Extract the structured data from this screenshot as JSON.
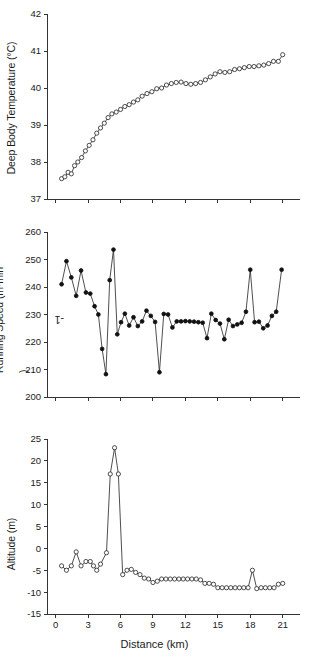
{
  "figure": {
    "title": "",
    "xlabel": "Distance (km)",
    "background": "#ffffff",
    "line_color": "#222222",
    "axis_color": "#333333"
  },
  "chart_data": [
    {
      "type": "line",
      "panel": "top",
      "title": "",
      "xlabel": "",
      "ylabel": "Deep Body Temperature (°C)",
      "ylabel_parts": {
        "text": "Deep Body Temperature (°C)"
      },
      "marker": "open-circle",
      "grid": false,
      "legend": "none",
      "xlim": [
        -0.8,
        22.6
      ],
      "ylim": [
        37,
        42
      ],
      "yticks": [
        37,
        38,
        39,
        40,
        41,
        42
      ],
      "ytick_labels": [
        "37",
        "38",
        "39",
        "40",
        "41",
        "42"
      ],
      "xticks": [
        0,
        3,
        6,
        9,
        12,
        15,
        18,
        21
      ],
      "xtick_labels": [],
      "x": [
        0.55,
        0.85,
        1.15,
        1.45,
        1.75,
        2.05,
        2.4,
        2.75,
        3.1,
        3.45,
        3.8,
        4.15,
        4.5,
        4.85,
        5.2,
        5.6,
        6.0,
        6.4,
        6.8,
        7.2,
        7.6,
        8.0,
        8.45,
        8.9,
        9.35,
        9.8,
        10.25,
        10.7,
        11.15,
        11.6,
        12.05,
        12.5,
        12.95,
        13.4,
        13.85,
        14.3,
        14.75,
        15.2,
        15.65,
        16.1,
        16.55,
        17.0,
        17.45,
        17.9,
        18.35,
        18.8,
        19.25,
        19.7,
        20.15,
        20.6,
        21.0
      ],
      "y": [
        37.55,
        37.6,
        37.72,
        37.68,
        37.9,
        38.0,
        38.12,
        38.3,
        38.45,
        38.6,
        38.78,
        38.92,
        39.05,
        39.2,
        39.3,
        39.35,
        39.42,
        39.5,
        39.55,
        39.62,
        39.68,
        39.78,
        39.85,
        39.9,
        39.98,
        40.0,
        40.08,
        40.12,
        40.15,
        40.16,
        40.12,
        40.1,
        40.12,
        40.15,
        40.22,
        40.3,
        40.38,
        40.44,
        40.42,
        40.44,
        40.5,
        40.52,
        40.55,
        40.58,
        40.58,
        40.6,
        40.62,
        40.66,
        40.72,
        40.72,
        40.9
      ]
    },
    {
      "type": "line",
      "panel": "middle",
      "title": "",
      "xlabel": "",
      "ylabel": "Running Speed (m·min⁻¹)",
      "marker": "filled-circle",
      "grid": false,
      "legend": "none",
      "xlim": [
        -0.8,
        22.6
      ],
      "ylim": [
        200,
        260
      ],
      "yticks": [
        200,
        210,
        220,
        230,
        240,
        250,
        260
      ],
      "ytick_labels": [
        "200",
        "210",
        "220",
        "230",
        "240",
        "250",
        "260"
      ],
      "xticks": [
        0,
        3,
        6,
        9,
        12,
        15,
        18,
        21
      ],
      "xtick_labels": [],
      "x": [
        0.55,
        1.0,
        1.45,
        1.9,
        2.35,
        2.8,
        3.2,
        3.6,
        3.95,
        4.3,
        4.65,
        5.0,
        5.35,
        5.7,
        6.05,
        6.4,
        6.8,
        7.2,
        7.6,
        8.0,
        8.4,
        8.8,
        9.2,
        9.6,
        10.0,
        10.4,
        10.8,
        11.2,
        11.6,
        12.0,
        12.4,
        12.8,
        13.2,
        13.6,
        14.0,
        14.4,
        14.8,
        15.2,
        15.6,
        16.0,
        16.4,
        16.8,
        17.2,
        17.6,
        18.0,
        18.4,
        18.8,
        19.2,
        19.6,
        20.0,
        20.4,
        20.9
      ],
      "y": [
        241.0,
        249.4,
        243.5,
        236.8,
        246.0,
        238.0,
        237.6,
        233.0,
        230.0,
        217.5,
        208.3,
        242.5,
        253.6,
        222.8,
        227.2,
        230.3,
        226.0,
        229.0,
        225.8,
        227.5,
        231.4,
        229.5,
        227.3,
        209.0,
        230.2,
        230.0,
        225.3,
        227.5,
        227.5,
        227.6,
        227.5,
        227.4,
        227.2,
        227.0,
        221.4,
        230.3,
        228.0,
        226.7,
        221.0,
        228.1,
        225.8,
        226.4,
        227.0,
        231.0,
        246.3,
        227.2,
        227.4,
        225.0,
        226.0,
        229.5,
        231.0,
        246.3
      ]
    },
    {
      "type": "line",
      "panel": "bottom",
      "title": "",
      "xlabel": "Distance (km)",
      "ylabel": "Altitude (m)",
      "marker": "open-circle",
      "grid": false,
      "legend": "none",
      "xlim": [
        -0.8,
        22.6
      ],
      "ylim": [
        -15,
        25
      ],
      "yticks": [
        -15,
        -10,
        -5,
        0,
        5,
        10,
        15,
        20,
        25
      ],
      "ytick_labels": [
        "-15",
        "-10",
        "-5",
        "0",
        "5",
        "10",
        "15",
        "20",
        "25"
      ],
      "xticks": [
        0,
        3,
        6,
        9,
        12,
        15,
        18,
        21
      ],
      "xtick_labels": [
        "0",
        "3",
        "6",
        "9",
        "12",
        "15",
        "18",
        "21"
      ],
      "x": [
        0.55,
        1.0,
        1.45,
        1.9,
        2.35,
        2.8,
        3.2,
        3.5,
        3.8,
        4.15,
        4.7,
        5.05,
        5.45,
        5.8,
        6.2,
        6.6,
        7.0,
        7.4,
        7.8,
        8.2,
        8.6,
        9.0,
        9.4,
        9.8,
        10.2,
        10.6,
        11.0,
        11.4,
        11.8,
        12.2,
        12.6,
        13.0,
        13.4,
        13.8,
        14.2,
        14.6,
        15.0,
        15.4,
        15.8,
        16.2,
        16.6,
        17.0,
        17.4,
        17.8,
        18.2,
        18.6,
        19.0,
        19.4,
        19.8,
        20.2,
        20.6,
        21.0
      ],
      "y": [
        -4.0,
        -5.0,
        -4.0,
        -0.8,
        -4.0,
        -3.0,
        -3.0,
        -4.0,
        -5.0,
        -3.6,
        -1.0,
        17.0,
        23.0,
        17.0,
        -6.0,
        -5.0,
        -4.8,
        -5.5,
        -6.0,
        -6.8,
        -7.0,
        -7.8,
        -7.5,
        -7.0,
        -7.0,
        -7.0,
        -7.0,
        -7.0,
        -7.0,
        -7.0,
        -7.0,
        -7.0,
        -7.2,
        -8.0,
        -8.0,
        -8.2,
        -9.0,
        -9.0,
        -9.0,
        -9.0,
        -9.0,
        -9.0,
        -9.0,
        -9.0,
        -5.0,
        -9.2,
        -9.0,
        -9.0,
        -9.0,
        -9.0,
        -8.2,
        -8.0
      ]
    }
  ]
}
